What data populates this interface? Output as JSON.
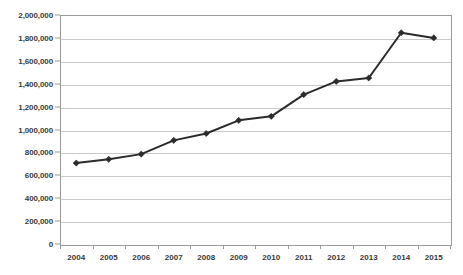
{
  "chart_data": {
    "type": "line",
    "title": "",
    "xlabel": "",
    "ylabel": "",
    "categories": [
      "2004",
      "2005",
      "2006",
      "2007",
      "2008",
      "2009",
      "2010",
      "2011",
      "2012",
      "2013",
      "2014",
      "2015"
    ],
    "values": [
      707000,
      740000,
      785000,
      905000,
      965000,
      1080000,
      1115000,
      1305000,
      1420000,
      1450000,
      1845000,
      1800000
    ],
    "series": [
      {
        "name": "",
        "values": [
          707000,
          740000,
          785000,
          905000,
          965000,
          1080000,
          1115000,
          1305000,
          1420000,
          1450000,
          1845000,
          1800000
        ]
      }
    ],
    "ylim": [
      0,
      2000000
    ],
    "ytick_step": 200000,
    "ytick_labels": [
      "0",
      "200,000",
      "400,000",
      "600,000",
      "800,000",
      "1,000,000",
      "1,200,000",
      "1,400,000",
      "1,600,000",
      "1,800,000",
      "2,000,000"
    ],
    "ytick_values": [
      0,
      200000,
      400000,
      600000,
      800000,
      1000000,
      1200000,
      1400000,
      1600000,
      1800000,
      2000000
    ],
    "grid": true,
    "legend": false,
    "legend_position": "none",
    "marker": "diamond",
    "line_color": "#2b2b2b",
    "marker_color": "#2b2b2b",
    "grid_color": "#c9c9c9",
    "axis_color": "#9a9a9a",
    "plot_background": "#ffffff",
    "annotations": []
  }
}
